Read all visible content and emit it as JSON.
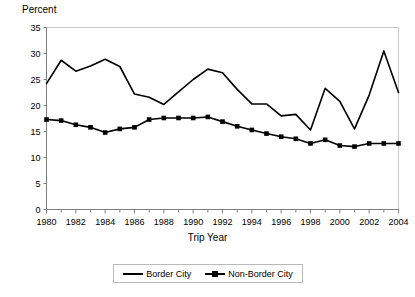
{
  "chart_data": {
    "type": "line",
    "title": "",
    "xlabel": "Trip Year",
    "ylabel": "Percent",
    "ylim": [
      0,
      35
    ],
    "ytick_step": 5,
    "yticks": [
      "0",
      "5",
      "10",
      "15",
      "20",
      "25",
      "30",
      "35"
    ],
    "xlim": [
      1980,
      2004
    ],
    "x": [
      1980,
      1981,
      1982,
      1983,
      1984,
      1985,
      1986,
      1987,
      1988,
      1989,
      1990,
      1991,
      1992,
      1993,
      1994,
      1995,
      1996,
      1997,
      1998,
      1999,
      2000,
      2001,
      2002,
      2003,
      2004
    ],
    "xticks": [
      "1980",
      "1982",
      "1984",
      "1986",
      "1988",
      "1990",
      "1992",
      "1994",
      "1996",
      "1998",
      "2000",
      "2002",
      "2004"
    ],
    "xtick_years": [
      1980,
      1982,
      1984,
      1986,
      1988,
      1990,
      1992,
      1994,
      1996,
      1998,
      2000,
      2002,
      2004
    ],
    "grid": false,
    "legend_position": "bottom",
    "series": [
      {
        "name": "Border City",
        "marker": "none",
        "color": "#000000",
        "values": [
          24.2,
          28.7,
          26.6,
          27.6,
          28.9,
          27.5,
          22.2,
          21.6,
          20.2,
          22.6,
          25.0,
          27.0,
          26.3,
          23.1,
          20.3,
          20.3,
          18.0,
          18.3,
          15.3,
          23.3,
          20.8,
          15.5,
          22.0,
          30.5,
          22.5
        ]
      },
      {
        "name": "Non-Border City",
        "marker": "square",
        "color": "#000000",
        "values": [
          17.3,
          17.1,
          16.3,
          15.8,
          14.8,
          15.5,
          15.8,
          17.3,
          17.6,
          17.6,
          17.6,
          17.8,
          16.9,
          16.0,
          15.3,
          14.6,
          14.0,
          13.6,
          12.7,
          13.4,
          12.3,
          12.1,
          12.7,
          12.7,
          12.7
        ]
      }
    ]
  },
  "axes": {
    "y_axis_label": "Percent",
    "x_axis_label": "Trip Year"
  },
  "legend": {
    "items": [
      {
        "label": "Border City"
      },
      {
        "label": "Non-Border City"
      }
    ]
  }
}
